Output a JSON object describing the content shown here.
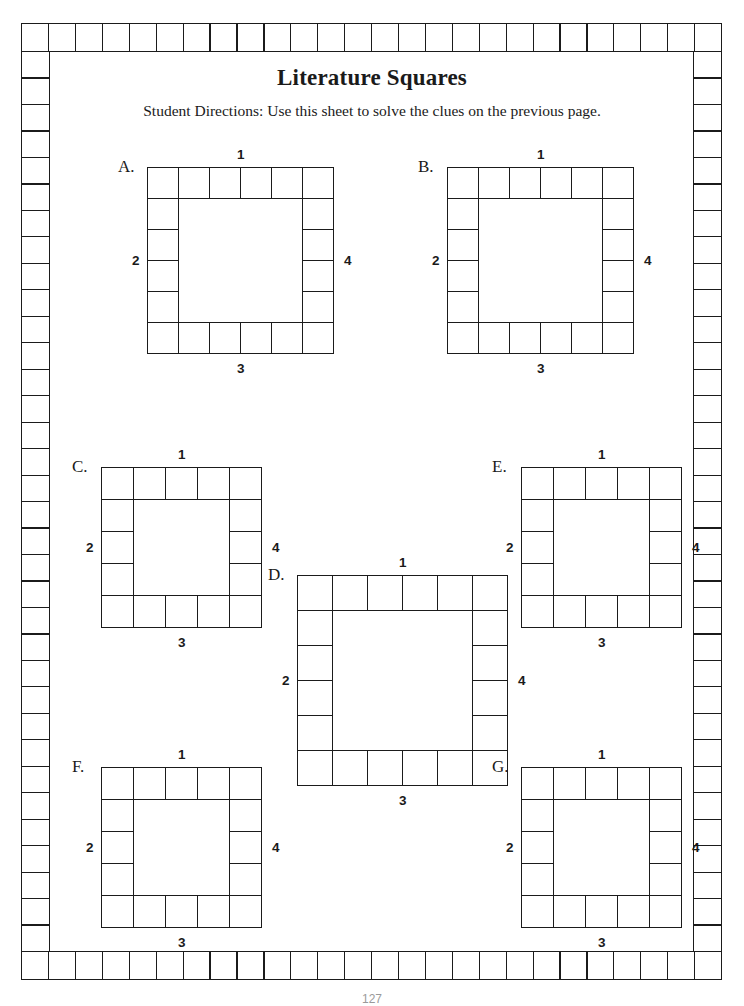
{
  "page": {
    "title": "Literature Squares",
    "directions": "Student Directions: Use this sheet to solve the clues on the previous page.",
    "page_number": "127",
    "background_color": "#ffffff",
    "ink_color": "#1b1b1b"
  },
  "frame": {
    "name": "decorative-checker-border",
    "top_cells": 26,
    "bottom_cells": 26,
    "left_cells": 34,
    "right_cells": 34
  },
  "side_labels": {
    "top": "1",
    "left": "2",
    "bottom": "3",
    "right": "4"
  },
  "puzzles": [
    {
      "letter": "A.",
      "size": 6,
      "labels": {
        "top": "1",
        "left": "2",
        "bottom": "3",
        "right": "4"
      },
      "position": {
        "left": 68,
        "top": 90,
        "cell": 31
      }
    },
    {
      "letter": "B.",
      "size": 6,
      "labels": {
        "top": "1",
        "left": "2",
        "bottom": "3",
        "right": "4"
      },
      "position": {
        "left": 368,
        "top": 90,
        "cell": 31
      }
    },
    {
      "letter": "C.",
      "size": 5,
      "labels": {
        "top": "1",
        "left": "2",
        "bottom": "3",
        "right": "4"
      },
      "position": {
        "left": 22,
        "top": 390,
        "cell": 32
      }
    },
    {
      "letter": "D.",
      "size": 6,
      "labels": {
        "top": "1",
        "left": "2",
        "bottom": "3",
        "right": "4"
      },
      "position": {
        "left": 218,
        "top": 498,
        "cell": 35
      }
    },
    {
      "letter": "E.",
      "size": 5,
      "labels": {
        "top": "1",
        "left": "2",
        "bottom": "3",
        "right": "4"
      },
      "position": {
        "left": 442,
        "top": 390,
        "cell": 32
      }
    },
    {
      "letter": "F.",
      "size": 5,
      "labels": {
        "top": "1",
        "left": "2",
        "bottom": "3",
        "right": "4"
      },
      "position": {
        "left": 22,
        "top": 690,
        "cell": 32
      }
    },
    {
      "letter": "G.",
      "size": 5,
      "labels": {
        "top": "1",
        "left": "2",
        "bottom": "3",
        "right": "4"
      },
      "position": {
        "left": 442,
        "top": 690,
        "cell": 32
      }
    }
  ]
}
